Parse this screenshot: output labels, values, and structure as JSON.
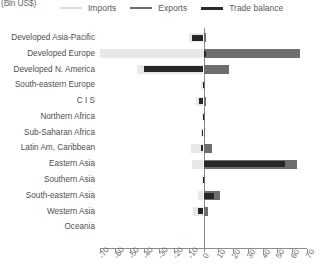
{
  "units_label": "(Bln US$)",
  "legend": {
    "items": [
      {
        "key": "imports",
        "label": "Imports",
        "color": "#dcdcdc"
      },
      {
        "key": "exports",
        "label": "Exports",
        "color": "#6e6e6e"
      },
      {
        "key": "balance",
        "label": "Trade balance",
        "color": "#2b2b2b"
      }
    ]
  },
  "chart_data": {
    "type": "bar",
    "orientation": "horizontal",
    "title": "",
    "subtitle": "",
    "xlabel": "(Bln US$)",
    "ylabel": "",
    "xlim": [
      -70,
      70
    ],
    "xticks": [
      -70,
      -60,
      -50,
      -40,
      -30,
      -20,
      -10,
      0,
      10,
      20,
      30,
      40,
      50,
      60,
      70
    ],
    "xticklabels": [
      "-70",
      "-60",
      "-50",
      "-40",
      "-30",
      "-20",
      "-10",
      "0",
      "10",
      "20",
      "30",
      "40",
      "50",
      "60",
      "70"
    ],
    "grid": false,
    "legend_position": "top",
    "categories": [
      "Developed Asia-Pacific",
      "Developed Europe",
      "Developed N. America",
      "South-eastern Europe",
      "C I S",
      "Northern Africa",
      "Sub-Saharan Africa",
      "Latin Am, Caribbean",
      "Eastern Asia",
      "Southern Asia",
      "South-eastern Asia",
      "Western Asia",
      "Oceania"
    ],
    "series": [
      {
        "name": "Imports",
        "color": "#e8e8e8",
        "values": [
          -9.5,
          -70.0,
          -45.0,
          -1.5,
          -5.0,
          -1.0,
          -2.0,
          -8.5,
          -8.0,
          -1.0,
          -4.0,
          -7.0,
          0.0
        ]
      },
      {
        "name": "Exports",
        "color": "#6e6e6e",
        "values": [
          1.5,
          65.0,
          17.0,
          1.0,
          2.0,
          0.5,
          1.0,
          6.0,
          63.0,
          0.5,
          11.0,
          3.0,
          0.0
        ]
      },
      {
        "name": "Trade balance",
        "color": "#262626",
        "values": [
          -8.0,
          2.0,
          -40.0,
          -0.5,
          -3.0,
          -0.5,
          -1.0,
          -2.0,
          55.0,
          -0.5,
          7.0,
          -4.0,
          0.0
        ]
      }
    ]
  }
}
